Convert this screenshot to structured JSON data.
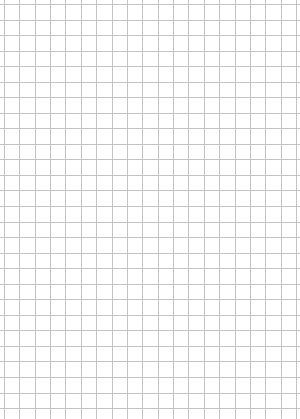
{
  "sheet": {
    "type": "grid-paper",
    "background_color": "#ffffff",
    "line_color": "#c4c4c4",
    "grid": {
      "vertical_start_x": 4,
      "vertical_spacing": 15.37,
      "vertical_count": 20,
      "horizontal_start_y": 4,
      "horizontal_spacing": 15.54,
      "horizontal_count": 27
    }
  }
}
